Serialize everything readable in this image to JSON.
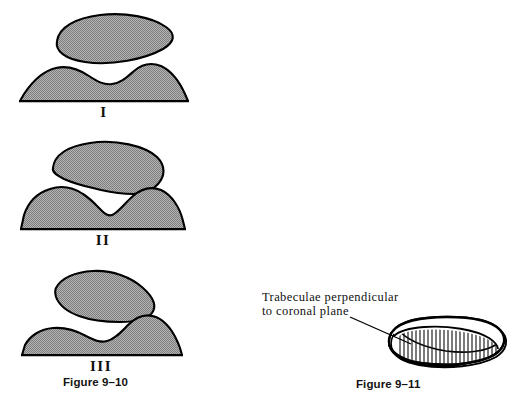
{
  "page": {
    "background_color": "#ffffff",
    "width": 523,
    "height": 403
  },
  "style": {
    "shape_fill": "#9e9e9e",
    "shape_stroke": "#000000",
    "hatch_stroke": "#1a1a1a",
    "text_color": "#111111"
  },
  "figure_9_10": {
    "caption": "Figure 9–10",
    "panels": [
      {
        "label": "I",
        "description": "Flattened oval upper body above a broad flat-based mound with a shallow central saddle"
      },
      {
        "label": "II",
        "description": "Wedge-shaped upper body with pointed inferior apex above a mound with a deep central V notch"
      },
      {
        "label": "III",
        "description": "Asymmetric tilted upper body above an asymmetric mound with a high right hump"
      }
    ]
  },
  "figure_9_11": {
    "caption": "Figure 9–11",
    "annotation": {
      "line1": "Trabeculae perpendicular",
      "line2": "to coronal plane"
    },
    "description": "Lens-shaped vertebral body seen from above with vertical trabecular hatching"
  }
}
